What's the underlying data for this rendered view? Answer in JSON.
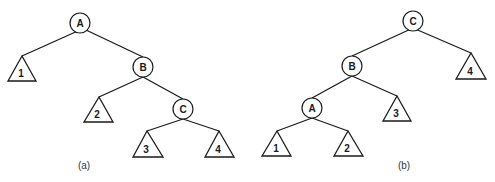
{
  "diagram": {
    "trees": [
      {
        "caption": "(a)",
        "nodes": [
          {
            "id": "A",
            "label": "A"
          },
          {
            "id": "B",
            "label": "B"
          },
          {
            "id": "C",
            "label": "C"
          }
        ],
        "subtrees": [
          {
            "id": "1",
            "label": "1"
          },
          {
            "id": "2",
            "label": "2"
          },
          {
            "id": "3",
            "label": "3"
          },
          {
            "id": "4",
            "label": "4"
          }
        ],
        "edges": [
          [
            "A",
            "1"
          ],
          [
            "A",
            "B"
          ],
          [
            "B",
            "2"
          ],
          [
            "B",
            "C"
          ],
          [
            "C",
            "3"
          ],
          [
            "C",
            "4"
          ]
        ]
      },
      {
        "caption": "(b)",
        "nodes": [
          {
            "id": "C",
            "label": "C"
          },
          {
            "id": "B",
            "label": "B"
          },
          {
            "id": "A",
            "label": "A"
          }
        ],
        "subtrees": [
          {
            "id": "4",
            "label": "4"
          },
          {
            "id": "3",
            "label": "3"
          },
          {
            "id": "1",
            "label": "1"
          },
          {
            "id": "2",
            "label": "2"
          }
        ],
        "edges": [
          [
            "C",
            "B"
          ],
          [
            "C",
            "4"
          ],
          [
            "B",
            "A"
          ],
          [
            "B",
            "3"
          ],
          [
            "A",
            "1"
          ],
          [
            "A",
            "2"
          ]
        ]
      }
    ]
  }
}
